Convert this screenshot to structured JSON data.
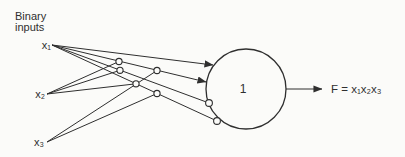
{
  "figure": {
    "background": "#fbfbf9",
    "ink": "#2f2f2f",
    "caption": {
      "line1": "Binary",
      "line2": "inputs"
    },
    "inputs": [
      {
        "id": "x1",
        "label": "x₁"
      },
      {
        "id": "x2",
        "label": "x₂"
      },
      {
        "id": "x3",
        "label": "x₃"
      }
    ],
    "neuron": {
      "label": "1",
      "shape": "circle"
    },
    "output": {
      "label": "F = x₁x₂x₃"
    },
    "connections": [
      {
        "from": "x1",
        "to": "cell",
        "ending": "arrowhead"
      },
      {
        "from": "x1",
        "to": "cell",
        "ending": "arrowhead"
      },
      {
        "from": "x1",
        "to": "cell",
        "ending": "open-circle"
      },
      {
        "from": "x1",
        "to": "cell",
        "ending": "open-circle"
      },
      {
        "from": "x2",
        "to": "fiber-junction",
        "ending": "open-circle"
      },
      {
        "from": "x2",
        "to": "fiber-junction",
        "ending": "open-circle"
      },
      {
        "from": "x2",
        "to": "fiber-junction",
        "ending": "open-circle"
      },
      {
        "from": "x3",
        "to": "fiber-junction",
        "ending": "open-circle"
      },
      {
        "from": "x3",
        "to": "fiber-junction",
        "ending": "open-circle"
      },
      {
        "from": "cell",
        "to": "output",
        "ending": "arrowhead"
      }
    ]
  }
}
